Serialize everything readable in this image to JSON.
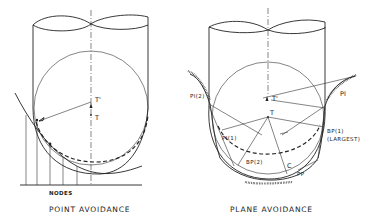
{
  "left_figure": {
    "caption": "POINT AVOIDANCE",
    "labels": {
      "t_prime": "T'",
      "t": "T",
      "nodes": "NODES"
    }
  },
  "right_figure": {
    "caption": "PLANE AVOIDANCE",
    "labels": {
      "pi2": "PI(2)",
      "pi": "PI",
      "t_prime": "T'",
      "t": "T",
      "pi1": "PI(1)",
      "bp1": "BP(1)",
      "bp1_note": "(LARGEST)",
      "bp2": "BP(2)",
      "c": "C",
      "pp": "PP"
    }
  },
  "colors": {
    "ink": "#222222",
    "background": "#ffffff"
  }
}
